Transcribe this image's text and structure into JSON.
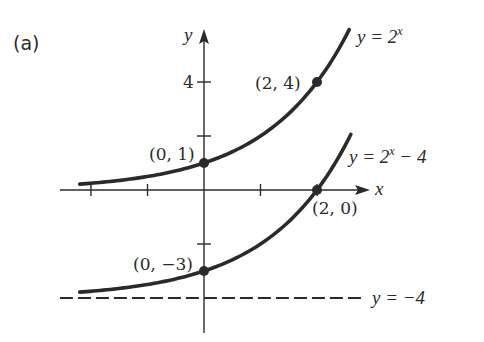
{
  "chart_data": {
    "type": "line",
    "panel_label": "(a)",
    "title": "",
    "xlabel": "x",
    "ylabel": "y",
    "xlim": [
      -2.5,
      2.9
    ],
    "ylim": [
      -5.4,
      5.9
    ],
    "x_ticks": [
      -2,
      -1,
      1,
      2
    ],
    "y_ticks": [
      -2,
      2,
      4
    ],
    "y_tick_labels": [
      {
        "value": 4,
        "label": "4"
      }
    ],
    "grid": false,
    "series": [
      {
        "name": "y = 2^x",
        "label_base": "y = 2",
        "label_exp": "x",
        "label_tail": "",
        "formula": "exp2",
        "shift": 0,
        "x_range": [
          -2.2,
          2.57
        ],
        "style": "solid"
      },
      {
        "name": "y = 2^x − 4",
        "label_base": "y = 2",
        "label_exp": "x",
        "label_tail": " − 4",
        "formula": "exp2",
        "shift": -4,
        "x_range": [
          -2.2,
          2.6
        ],
        "style": "solid"
      }
    ],
    "asymptote": {
      "name": "y = −4",
      "label": "y = −4",
      "y": -4,
      "x_range": [
        -2.55,
        2.8
      ],
      "style": "dashed"
    },
    "points": [
      {
        "x": 0,
        "y": 1,
        "label": "(0, 1)"
      },
      {
        "x": 2,
        "y": 4,
        "label": "(2, 4)"
      },
      {
        "x": 0,
        "y": -3,
        "label": "(0, −3)"
      },
      {
        "x": 2,
        "y": 0,
        "label": "(2, 0)"
      }
    ],
    "colors": {
      "ink": "#2a2a2a",
      "background": "#ffffff"
    }
  }
}
